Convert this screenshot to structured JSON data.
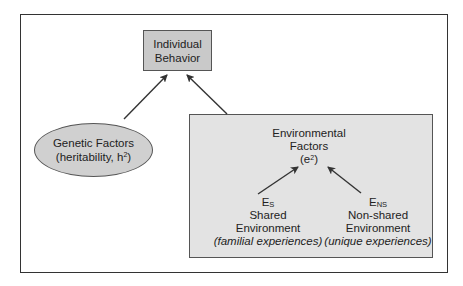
{
  "diagram": {
    "outcome": {
      "line1": "Individual",
      "line2": "Behavior"
    },
    "genetic": {
      "line1": "Genetic Factors",
      "line2_prefix": "(heritability, h",
      "line2_sup": "2",
      "line2_suffix": ")"
    },
    "environmental": {
      "line1": "Environmental",
      "line2": "Factors",
      "line3_prefix": "(e",
      "line3_sup": "2",
      "line3_suffix": ")",
      "shared": {
        "symbol": "E",
        "subscript": "S",
        "label1": "Shared",
        "label2": "Environment",
        "note": "(familial experiences)"
      },
      "nonshared": {
        "symbol": "E",
        "subscript": "NS",
        "label1": "Non-shared",
        "label2": "Environment",
        "note": "(unique experiences)"
      }
    },
    "colors": {
      "outcome_fill": "#c9c9c9",
      "genetic_fill": "#d0d0d0",
      "env_fill": "#e3e3e3",
      "stroke": "#333333"
    }
  }
}
